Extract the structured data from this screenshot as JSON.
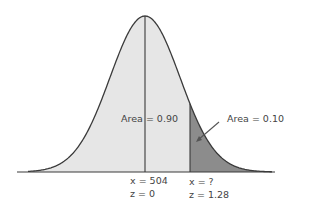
{
  "diagram": {
    "type": "normal-distribution",
    "mean_label": {
      "x": "x = 504",
      "z": "z = 0"
    },
    "cutoff_label": {
      "x": "x = ?",
      "z": "z = 1.28"
    },
    "left_area_label": "Area = 0.90",
    "right_area_label": "Area = 0.10",
    "colors": {
      "curve": "#3a3a3a",
      "left_fill": "#e6e6e6",
      "right_fill": "#8c8c8c",
      "axis": "#3a3a3a"
    }
  }
}
